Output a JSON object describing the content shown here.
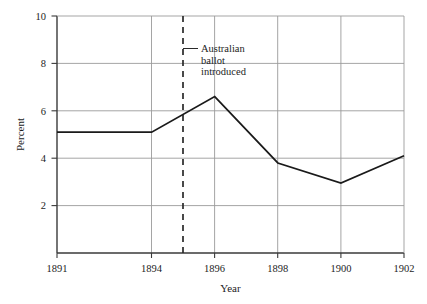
{
  "chart_data": {
    "type": "line",
    "title": "",
    "xlabel": "Year",
    "ylabel": "Percent",
    "x": [
      1891,
      1894,
      1896,
      1898,
      1900,
      1902
    ],
    "values": [
      5.1,
      5.1,
      6.6,
      3.8,
      2.95,
      4.1
    ],
    "series": [
      {
        "name": "Percent",
        "values": [
          5.1,
          5.1,
          6.6,
          3.8,
          2.95,
          4.1
        ]
      }
    ],
    "xlim": [
      1891,
      1902
    ],
    "ylim": [
      0,
      10
    ],
    "xticks": [
      1891,
      1894,
      1896,
      1898,
      1900,
      1902
    ],
    "xtick_labels": [
      "1891",
      "1894",
      "1896",
      "1898",
      "1900",
      "1902"
    ],
    "yticks": [
      2,
      4,
      6,
      8,
      10
    ],
    "ytick_labels": [
      "2",
      "4",
      "6",
      "8",
      "10"
    ],
    "grid": "horizontal-and-vertical",
    "legend": "none",
    "line_color": "#1a1a1a",
    "grid_color": "#9a9a9a",
    "axis_color": "#3a3a3a",
    "annotations": [
      {
        "name": "australian-ballot-marker",
        "x": 1895,
        "style": "dashed-vertical-line",
        "lines": [
          "Australian",
          "ballot",
          "introduced"
        ]
      }
    ]
  },
  "axes": {
    "x_title": "Year",
    "y_title": "Percent"
  },
  "annotation": {
    "line1": "Australian",
    "line2": "ballot",
    "line3": "introduced"
  }
}
